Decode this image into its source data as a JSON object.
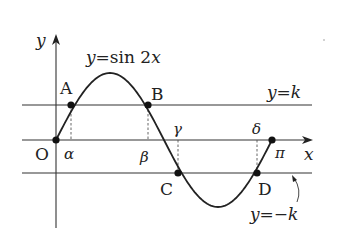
{
  "diagram": {
    "title": "y=sin 2x",
    "curve_label": "y=sin 2x",
    "function": "sin(2x)",
    "domain": [
      0,
      3.14159
    ],
    "axes": {
      "x_label": "x",
      "y_label": "y",
      "origin_label": "O",
      "pi_label": "π"
    },
    "lines": {
      "upper": "y=k",
      "lower": "y=−k"
    },
    "points": {
      "A": "A",
      "B": "B",
      "C": "C",
      "D": "D"
    },
    "x_marks": {
      "alpha": "α",
      "beta": "β",
      "gamma": "γ",
      "delta": "δ"
    },
    "colors": {
      "stroke": "#222222",
      "dashed": "#555555",
      "background": "#ffffff"
    }
  }
}
